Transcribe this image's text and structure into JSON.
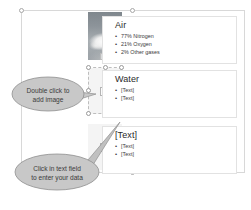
{
  "canvas": {
    "background": "#ffffff",
    "outer_frame": {
      "name": "smartart-graphic-frame",
      "handle_count": 3
    }
  },
  "panels": [
    {
      "id": "air",
      "title": "Air",
      "bullets": [
        "77% Nitrogen",
        "21% Oxygen",
        "2% Other gases"
      ],
      "picture": {
        "type": "photo",
        "description": "cloud-photo",
        "filled": true
      }
    },
    {
      "id": "water",
      "title": "Water",
      "bullets": [
        "[Text]",
        "[Text]"
      ],
      "picture": {
        "type": "placeholder",
        "description": "picture-placeholder",
        "filled": false,
        "selected": true
      }
    },
    {
      "id": "third",
      "title": "[Text]",
      "bullets": [
        "[Text]",
        "[Text]"
      ],
      "picture": {
        "type": "placeholder",
        "description": "picture-placeholder",
        "filled": false,
        "selected": false
      }
    }
  ],
  "callouts": [
    {
      "id": "add-image",
      "line1": "Double click to",
      "line2": "add image",
      "fill": "#c8c8c8",
      "stroke": "#8f8f8f"
    },
    {
      "id": "enter-data",
      "line1": "Click in text field",
      "line2": "to enter your data",
      "fill": "#c8c8c8",
      "stroke": "#8f8f8f"
    }
  ],
  "colors": {
    "panel_border": "#e2e2e2",
    "frame_border": "#d8d8d8",
    "text": "#3a3a3a",
    "title": "#2a2a2a"
  }
}
